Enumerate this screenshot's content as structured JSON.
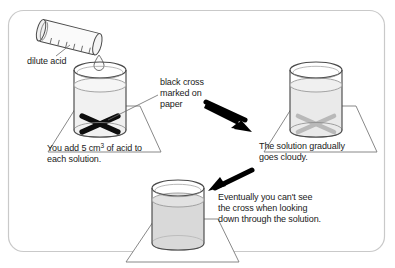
{
  "figure": {
    "frame": {
      "stroke": "#c9c9c9",
      "fill": "#ffffff",
      "radius": 14
    },
    "ink": "#3a3a3a",
    "arrow_color": "#000000",
    "cross_visible_color": "#000000",
    "cross_faded_color": "#b5b5b5",
    "liquid_clear": "#f2f2f2",
    "liquid_cloudy": "#d8d8d8"
  },
  "labels": {
    "dilute_acid": "dilute acid",
    "black_cross": "black cross\nmarked on\npaper",
    "you_add": "You add 5 cm3 of acid to\neach solution.",
    "you_add_line1_pre": "You add 5 cm",
    "you_add_sup": "3",
    "you_add_line1_post": " of acid to",
    "you_add_line2": "each solution.",
    "solution_cloudy": "The solution gradually\ngoes cloudy.",
    "eventually": "Eventually you can't see\nthe cross when looking\ndown through the solution."
  },
  "objects": {
    "measuring_cylinder": {
      "name": "dilute acid measuring cylinder",
      "graduation_marks": 6
    },
    "beaker_1": {
      "name": "beaker with clear solution",
      "cross_state": "visible"
    },
    "beaker_2": {
      "name": "beaker going cloudy",
      "cross_state": "faint"
    },
    "beaker_3": {
      "name": "beaker fully cloudy",
      "cross_state": "hidden"
    },
    "droplet": {
      "name": "acid droplet"
    },
    "arrow_1": {
      "name": "arrow to second beaker",
      "direction": "down-right"
    },
    "arrow_2": {
      "name": "arrow to third beaker",
      "direction": "down-left"
    }
  }
}
